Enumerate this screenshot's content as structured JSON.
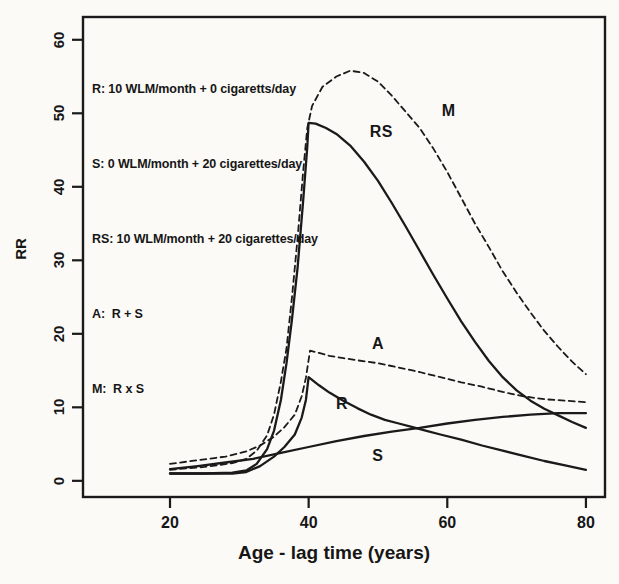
{
  "figure": {
    "background": "#fbfaf6",
    "ink": "#1a1a1a"
  },
  "legend": {
    "lines": [
      "R: 10 WLM/month + 0 cigaretts/day",
      "S: 0 WLM/month + 20 cigarettes/day",
      "RS: 10 WLM/month + 20 cigarettes/day",
      "A:  R + S",
      "M:  R x S"
    ]
  },
  "chart_data": {
    "type": "line",
    "title": "",
    "xlabel": "Age - lag time (years)",
    "ylabel": "RR",
    "grid": false,
    "x_axis": {
      "ticks": [
        20,
        40,
        60,
        80
      ],
      "lim": [
        7.45,
        82.75
      ]
    },
    "y_axis": {
      "ticks": [
        0,
        10,
        20,
        30,
        40,
        50,
        60
      ],
      "lim": [
        -2.2,
        63.1
      ]
    },
    "series": [
      {
        "name": "S",
        "style": "solid",
        "points": [
          [
            20,
            1.6
          ],
          [
            24,
            2.0
          ],
          [
            28,
            2.5
          ],
          [
            32,
            3.0
          ],
          [
            36,
            3.8
          ],
          [
            40,
            4.6
          ],
          [
            44,
            5.4
          ],
          [
            48,
            6.1
          ],
          [
            52,
            6.7
          ],
          [
            56,
            7.2
          ],
          [
            60,
            7.8
          ],
          [
            64,
            8.3
          ],
          [
            68,
            8.7
          ],
          [
            72,
            9.0
          ],
          [
            76,
            9.2
          ],
          [
            80,
            9.2
          ]
        ]
      },
      {
        "name": "R",
        "style": "solid",
        "points": [
          [
            20,
            1.0
          ],
          [
            25,
            1.0
          ],
          [
            29,
            1.0
          ],
          [
            31,
            1.2
          ],
          [
            33,
            2.0
          ],
          [
            35,
            3.3
          ],
          [
            36.5,
            4.6
          ],
          [
            38,
            6.3
          ],
          [
            39,
            8.6
          ],
          [
            39.6,
            11.0
          ],
          [
            40,
            14.1
          ],
          [
            41.5,
            13.0
          ],
          [
            43,
            12.0
          ],
          [
            45,
            10.9
          ],
          [
            47,
            9.9
          ],
          [
            49,
            9.0
          ],
          [
            51,
            8.3
          ],
          [
            53,
            7.8
          ],
          [
            55,
            7.3
          ],
          [
            57,
            6.8
          ],
          [
            59,
            6.3
          ],
          [
            62,
            5.6
          ],
          [
            65,
            4.8
          ],
          [
            68,
            4.1
          ],
          [
            71,
            3.4
          ],
          [
            74,
            2.7
          ],
          [
            77,
            2.1
          ],
          [
            80,
            1.5
          ]
        ]
      },
      {
        "name": "RS",
        "style": "solid",
        "points": [
          [
            20,
            1.0
          ],
          [
            25,
            1.0
          ],
          [
            29,
            1.1
          ],
          [
            31,
            1.4
          ],
          [
            32.5,
            2.3
          ],
          [
            34,
            4.3
          ],
          [
            35,
            6.8
          ],
          [
            36,
            11.0
          ],
          [
            36.8,
            16.0
          ],
          [
            37.6,
            22.0
          ],
          [
            38.4,
            29.0
          ],
          [
            39.2,
            38.0
          ],
          [
            39.8,
            45.5
          ],
          [
            40,
            48.7
          ],
          [
            41,
            48.6
          ],
          [
            42.5,
            48.0
          ],
          [
            44,
            47.2
          ],
          [
            46,
            45.6
          ],
          [
            48,
            43.4
          ],
          [
            50,
            40.8
          ],
          [
            52,
            37.8
          ],
          [
            54,
            34.6
          ],
          [
            56,
            31.3
          ],
          [
            58,
            28.0
          ],
          [
            60,
            24.8
          ],
          [
            62,
            21.7
          ],
          [
            64,
            18.9
          ],
          [
            66,
            16.3
          ],
          [
            68,
            14.1
          ],
          [
            70,
            12.3
          ],
          [
            72,
            10.9
          ],
          [
            74,
            9.8
          ],
          [
            76,
            8.9
          ],
          [
            78,
            8.0
          ],
          [
            80,
            7.2
          ]
        ]
      },
      {
        "name": "A",
        "style": "dashed",
        "points": [
          [
            20,
            2.3
          ],
          [
            24,
            2.8
          ],
          [
            28,
            3.3
          ],
          [
            31,
            4.0
          ],
          [
            33,
            4.8
          ],
          [
            35,
            6.0
          ],
          [
            36.5,
            7.3
          ],
          [
            38,
            9.0
          ],
          [
            39,
            11.5
          ],
          [
            39.6,
            14.0
          ],
          [
            40.2,
            17.7
          ],
          [
            41.5,
            17.4
          ],
          [
            43,
            17.0
          ],
          [
            45,
            16.7
          ],
          [
            47,
            16.4
          ],
          [
            50,
            16.0
          ],
          [
            53,
            15.4
          ],
          [
            56,
            14.8
          ],
          [
            59,
            14.1
          ],
          [
            62,
            13.4
          ],
          [
            65,
            12.8
          ],
          [
            68,
            12.1
          ],
          [
            71,
            11.5
          ],
          [
            74,
            11.1
          ],
          [
            77,
            10.9
          ],
          [
            80,
            10.7
          ]
        ]
      },
      {
        "name": "M",
        "style": "dashed",
        "points": [
          [
            20,
            1.5
          ],
          [
            25,
            1.9
          ],
          [
            29,
            2.4
          ],
          [
            31,
            3.0
          ],
          [
            32.5,
            4.1
          ],
          [
            34,
            6.2
          ],
          [
            35,
            9.0
          ],
          [
            36,
            13.5
          ],
          [
            36.8,
            18.0
          ],
          [
            37.6,
            25.0
          ],
          [
            38.4,
            33.0
          ],
          [
            39.2,
            42.0
          ],
          [
            39.8,
            48.0
          ],
          [
            40.5,
            51.0
          ],
          [
            42,
            53.6
          ],
          [
            44,
            55.0
          ],
          [
            46,
            55.8
          ],
          [
            48,
            55.5
          ],
          [
            50,
            54.3
          ],
          [
            52,
            52.4
          ],
          [
            54,
            50.2
          ],
          [
            56,
            48.0
          ],
          [
            58,
            45.2
          ],
          [
            60,
            42.0
          ],
          [
            62,
            38.5
          ],
          [
            64,
            35.0
          ],
          [
            66,
            31.8
          ],
          [
            68,
            28.5
          ],
          [
            70,
            25.6
          ],
          [
            72,
            22.9
          ],
          [
            74,
            20.4
          ],
          [
            76,
            18.2
          ],
          [
            78,
            16.2
          ],
          [
            80,
            14.5
          ]
        ]
      }
    ],
    "annotations": [
      {
        "label": "RS",
        "x": 50.5,
        "y": 47.5
      },
      {
        "label": "M",
        "x": 60.2,
        "y": 50.3
      },
      {
        "label": "A",
        "x": 50.0,
        "y": 18.6
      },
      {
        "label": "R",
        "x": 44.8,
        "y": 10.4
      },
      {
        "label": "S",
        "x": 50.0,
        "y": 3.4
      }
    ]
  }
}
